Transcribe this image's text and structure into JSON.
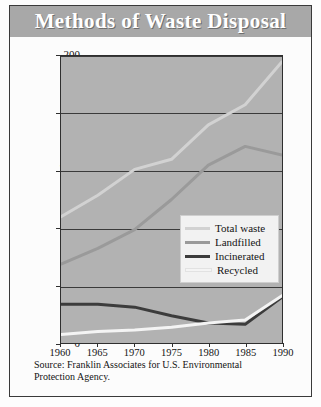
{
  "figure": {
    "title": "Methods of Waste Disposal",
    "source_line_1": "Source: Franklin Associates for U.S. Environmental",
    "source_line_2": "Protection Agency."
  },
  "colors": {
    "title_banner": "#a8a8a8",
    "title_text": "#ffffff",
    "plot_background": "#b2b2b2",
    "axis": "#2f2f2f",
    "total_waste": "#d2d2d2",
    "landfilled": "#9a9a9a",
    "incinerated": "#3c3c3c",
    "recycled": "#f4f4f4",
    "legend_background": "#f2f2f2"
  },
  "chart_data": {
    "type": "line",
    "title": "Methods of Waste Disposal",
    "xlabel": "",
    "ylabel": "Millions of tons",
    "xlim": [
      1960,
      1990
    ],
    "ylim": [
      0,
      200
    ],
    "xticks": [
      1960,
      1965,
      1970,
      1975,
      1980,
      1985,
      1990
    ],
    "yticks": [
      0,
      40,
      80,
      120,
      160,
      200
    ],
    "grid": true,
    "legend_position": "center-right",
    "x": [
      1960,
      1965,
      1970,
      1975,
      1980,
      1985,
      1990
    ],
    "series": [
      {
        "name": "Total waste",
        "color": "#d2d2d2",
        "values": [
          88,
          103,
          121,
          128,
          152,
          166,
          196
        ]
      },
      {
        "name": "Landfilled",
        "color": "#9a9a9a",
        "values": [
          55,
          66,
          79,
          100,
          124,
          137,
          131
        ]
      },
      {
        "name": "Incinerated",
        "color": "#3c3c3c",
        "values": [
          27,
          27,
          25,
          19,
          14,
          13,
          32
        ]
      },
      {
        "name": "Recycled",
        "color": "#f4f4f4",
        "values": [
          6,
          8,
          9,
          11,
          14,
          16,
          33
        ]
      }
    ]
  },
  "legend": {
    "items": [
      {
        "label": "Total waste"
      },
      {
        "label": "Landfilled"
      },
      {
        "label": "Incinerated"
      },
      {
        "label": "Recycled"
      }
    ]
  }
}
